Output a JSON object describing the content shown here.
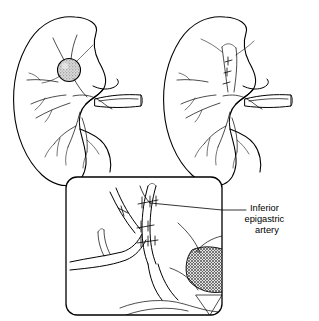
{
  "figure": {
    "background_color": "#ffffff",
    "ink_color": "#000000",
    "width": 319,
    "height": 321
  },
  "panels": [
    {
      "id": "left-kidney",
      "name": "Preoperative kidney with renal artery aneurysm",
      "side": "left",
      "has_lesion": true,
      "lesion": {
        "name": "renal-artery-aneurysm",
        "shape": "round",
        "fill": "stippled-gray",
        "fill_color": "#c9c9c9",
        "cx": 69,
        "cy": 70,
        "r": 11.5
      }
    },
    {
      "id": "right-kidney",
      "name": "Postoperative kidney after arterial reconstruction",
      "side": "right",
      "has_lesion": false,
      "has_sutures": true
    }
  ],
  "inset": {
    "name": "magnified-anastomosis-detail",
    "border_color": "#000000",
    "fill_color": "#ffffff",
    "corner_radius": 11,
    "x": 66,
    "y": 177,
    "width": 156,
    "height": 138,
    "hatched_region": {
      "name": "cross-hatched-muscle-region",
      "fill_color": "#b8b8b8",
      "pattern": "cross-hatch"
    },
    "suture_count": 11
  },
  "labels": [
    {
      "name": "inferior-epigastric-artery-label",
      "lines": [
        "Inferior",
        "epigastric",
        "artery"
      ],
      "text": "Inferior epigastric artery",
      "align": "center",
      "x": 276,
      "y": 213,
      "leader_from_x": 222,
      "leader_from_y": 210,
      "leader_to_x": 150,
      "leader_to_y": 203
    }
  ]
}
